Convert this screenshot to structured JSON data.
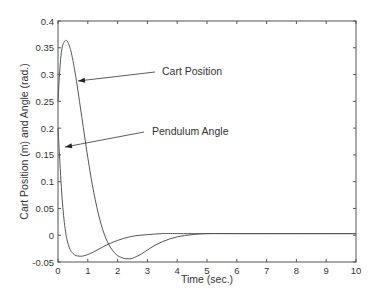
{
  "chart_data": {
    "type": "line",
    "title": "",
    "xlabel": "Time (sec.)",
    "ylabel": "Cart Position (m) and Angle (rad.)",
    "xlim": [
      0,
      10
    ],
    "ylim": [
      -0.05,
      0.4
    ],
    "xticks": [
      0,
      1,
      2,
      3,
      4,
      5,
      6,
      7,
      8,
      9,
      10
    ],
    "yticks": [
      -0.05,
      0,
      0.05,
      0.1,
      0.15,
      0.2,
      0.25,
      0.3,
      0.35,
      0.4
    ],
    "ytick_labels": [
      "-0.05",
      "0",
      "0.05",
      "0.1",
      "0.15",
      "0.2",
      "0.25",
      "0.3",
      "0.35",
      "0.4"
    ],
    "grid": false,
    "legend": "none",
    "series": [
      {
        "name": "Cart Position",
        "x": [
          0,
          0.05,
          0.1,
          0.15,
          0.2,
          0.27,
          0.35,
          0.45,
          0.6,
          0.8,
          1.0,
          1.2,
          1.4,
          1.6,
          1.8,
          2.0,
          2.2,
          2.35,
          2.5,
          2.8,
          3.1,
          3.5,
          4.0,
          4.5,
          5.0,
          6.0,
          7.0,
          8.0,
          9.0,
          10.0
        ],
        "values": [
          0.25,
          0.3,
          0.335,
          0.353,
          0.36,
          0.364,
          0.358,
          0.34,
          0.295,
          0.22,
          0.145,
          0.08,
          0.03,
          -0.005,
          -0.026,
          -0.038,
          -0.043,
          -0.044,
          -0.043,
          -0.035,
          -0.024,
          -0.012,
          -0.003,
          0.001,
          0.003,
          0.003,
          0.003,
          0.003,
          0.003,
          0.003
        ]
      },
      {
        "name": "Pendulum Angle",
        "x": [
          0,
          0.05,
          0.1,
          0.15,
          0.2,
          0.25,
          0.3,
          0.4,
          0.5,
          0.6,
          0.7,
          0.83,
          1.0,
          1.2,
          1.5,
          1.8,
          2.2,
          2.6,
          3.0,
          3.5,
          4.0,
          5.0,
          6.0,
          7.0,
          8.0,
          9.0,
          10.0
        ],
        "values": [
          0.2,
          0.15,
          0.1,
          0.06,
          0.03,
          0.008,
          -0.008,
          -0.026,
          -0.034,
          -0.038,
          -0.039,
          -0.039,
          -0.036,
          -0.031,
          -0.022,
          -0.014,
          -0.006,
          -0.001,
          0.001,
          0.003,
          0.003,
          0.003,
          0.003,
          0.003,
          0.003,
          0.003,
          0.003
        ]
      }
    ],
    "annotations": [
      {
        "text": "Cart Position",
        "text_x": 162,
        "text_y": 75,
        "arrow_from": [
          155,
          72
        ],
        "arrow_to": [
          78,
          81
        ]
      },
      {
        "text": "Pendulum Angle",
        "text_x": 152,
        "text_y": 135,
        "arrow_from": [
          144,
          132
        ],
        "arrow_to": [
          65,
          147
        ]
      }
    ],
    "colors": {
      "line": "#555555",
      "axis": "#555555",
      "text": "#333333"
    }
  }
}
